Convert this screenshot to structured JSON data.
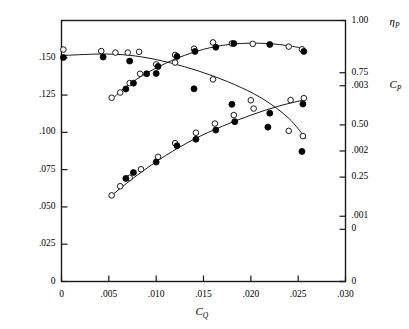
{
  "figure": {
    "background_color": "#ffffff",
    "line_color": "#1a1a1a",
    "marker_filled_color": "#000000",
    "marker_open_color": "#ffffff"
  },
  "chart_data": {
    "type": "scatter",
    "title": "",
    "subtitle": "",
    "grid": false,
    "legend_position": "none",
    "xlabel": "C_Q",
    "xlabel_base": "C",
    "xlabel_sub": "Q",
    "xlim": [
      0.0,
      0.03
    ],
    "x_ticks": [
      0.0,
      0.005,
      0.01,
      0.015,
      0.02,
      0.025,
      0.03
    ],
    "x_tick_labels": [
      "0",
      ".005",
      ".010",
      ".015",
      ".020",
      ".025",
      ".030"
    ],
    "left_axis": {
      "label_base": "C",
      "label_sub": "H",
      "lim": [
        0.0,
        0.175
      ],
      "ticks": [
        0.0,
        0.025,
        0.05,
        0.075,
        0.1,
        0.125,
        0.15
      ],
      "tick_labels": [
        "0",
        ".025",
        ".050",
        ".075",
        ".100",
        ".125",
        ".150"
      ]
    },
    "right_axis_top": {
      "label_base": "η",
      "label_sub": "P",
      "lim": [
        -0.25,
        1.0
      ],
      "ticks": [
        1.0,
        0.75,
        0.5,
        0.25,
        0.0
      ],
      "tick_labels": [
        "1.00",
        "0.75",
        "0.50",
        "0.25",
        "0"
      ]
    },
    "right_axis_bottom": {
      "label_base": "C",
      "label_sub": "P",
      "lim": [
        0.0,
        0.004
      ],
      "ticks": [
        0.003,
        0.002,
        0.001,
        0.0
      ],
      "tick_labels": [
        ".003",
        ".002",
        ".001",
        "0"
      ]
    },
    "series": [
      {
        "name": "eta_P measured (open)",
        "marker": "open-circle",
        "axis": "right_axis_top",
        "points": [
          {
            "x": 0.0053,
            "y": 0.63
          },
          {
            "x": 0.0062,
            "y": 0.655
          },
          {
            "x": 0.0072,
            "y": 0.7
          },
          {
            "x": 0.0083,
            "y": 0.745
          },
          {
            "x": 0.01,
            "y": 0.79
          },
          {
            "x": 0.012,
            "y": 0.835
          },
          {
            "x": 0.014,
            "y": 0.865
          },
          {
            "x": 0.016,
            "y": 0.895
          },
          {
            "x": 0.018,
            "y": 0.89
          },
          {
            "x": 0.0202,
            "y": 0.888
          },
          {
            "x": 0.024,
            "y": 0.875
          },
          {
            "x": 0.0254,
            "y": 0.862
          }
        ]
      },
      {
        "name": "eta_P predicted (filled)",
        "marker": "filled-circle",
        "axis": "right_axis_top",
        "points": [
          {
            "x": 0.0068,
            "y": 0.672
          },
          {
            "x": 0.0076,
            "y": 0.7
          },
          {
            "x": 0.009,
            "y": 0.745
          },
          {
            "x": 0.0102,
            "y": 0.78
          },
          {
            "x": 0.0122,
            "y": 0.828
          },
          {
            "x": 0.0141,
            "y": 0.852
          },
          {
            "x": 0.0163,
            "y": 0.872
          },
          {
            "x": 0.0182,
            "y": 0.89
          },
          {
            "x": 0.022,
            "y": 0.885
          },
          {
            "x": 0.0256,
            "y": 0.852
          }
        ]
      },
      {
        "name": "eta_P fitted curve",
        "marker": "line",
        "axis": "right_axis_top",
        "points": [
          {
            "x": 0.0053,
            "y": 0.622
          },
          {
            "x": 0.007,
            "y": 0.69
          },
          {
            "x": 0.009,
            "y": 0.748
          },
          {
            "x": 0.011,
            "y": 0.795
          },
          {
            "x": 0.013,
            "y": 0.833
          },
          {
            "x": 0.015,
            "y": 0.862
          },
          {
            "x": 0.017,
            "y": 0.881
          },
          {
            "x": 0.019,
            "y": 0.89
          },
          {
            "x": 0.021,
            "y": 0.891
          },
          {
            "x": 0.023,
            "y": 0.885
          },
          {
            "x": 0.0255,
            "y": 0.868
          }
        ]
      },
      {
        "name": "C_H measured (open)",
        "marker": "open-circle",
        "axis": "left_axis",
        "points": [
          {
            "x": 0.0002,
            "y": 0.1555
          },
          {
            "x": 0.0042,
            "y": 0.1545
          },
          {
            "x": 0.0057,
            "y": 0.1535
          },
          {
            "x": 0.007,
            "y": 0.1535
          },
          {
            "x": 0.0082,
            "y": 0.154
          },
          {
            "x": 0.012,
            "y": 0.1468
          },
          {
            "x": 0.016,
            "y": 0.1355
          },
          {
            "x": 0.02,
            "y": 0.1215
          },
          {
            "x": 0.024,
            "y": 0.101
          },
          {
            "x": 0.0255,
            "y": 0.0975
          }
        ]
      },
      {
        "name": "C_H predicted (filled)",
        "marker": "filled-circle",
        "axis": "left_axis",
        "points": [
          {
            "x": 0.0002,
            "y": 0.1502
          },
          {
            "x": 0.0044,
            "y": 0.1505
          },
          {
            "x": 0.0072,
            "y": 0.1478
          },
          {
            "x": 0.01,
            "y": 0.1395
          },
          {
            "x": 0.014,
            "y": 0.1292
          },
          {
            "x": 0.018,
            "y": 0.1188
          },
          {
            "x": 0.0218,
            "y": 0.1035
          },
          {
            "x": 0.0254,
            "y": 0.0872
          }
        ]
      },
      {
        "name": "C_H fitted curve",
        "marker": "line",
        "axis": "left_axis",
        "points": [
          {
            "x": 0.0,
            "y": 0.1515
          },
          {
            "x": 0.004,
            "y": 0.1525
          },
          {
            "x": 0.007,
            "y": 0.1518
          },
          {
            "x": 0.01,
            "y": 0.1488
          },
          {
            "x": 0.013,
            "y": 0.144
          },
          {
            "x": 0.016,
            "y": 0.1378
          },
          {
            "x": 0.019,
            "y": 0.13
          },
          {
            "x": 0.0215,
            "y": 0.1215
          },
          {
            "x": 0.024,
            "y": 0.1095
          },
          {
            "x": 0.0258,
            "y": 0.096
          }
        ]
      },
      {
        "name": "C_P measured (open)",
        "marker": "open-circle",
        "axis": "right_axis_bottom",
        "points": [
          {
            "x": 0.0053,
            "y": 0.00132
          },
          {
            "x": 0.0062,
            "y": 0.00146
          },
          {
            "x": 0.0072,
            "y": 0.00159
          },
          {
            "x": 0.0084,
            "y": 0.00172
          },
          {
            "x": 0.0102,
            "y": 0.00191
          },
          {
            "x": 0.012,
            "y": 0.00212
          },
          {
            "x": 0.0142,
            "y": 0.00228
          },
          {
            "x": 0.0162,
            "y": 0.00242
          },
          {
            "x": 0.0182,
            "y": 0.00255
          },
          {
            "x": 0.0203,
            "y": 0.00265
          },
          {
            "x": 0.0242,
            "y": 0.00278
          },
          {
            "x": 0.0256,
            "y": 0.00281
          }
        ]
      },
      {
        "name": "C_P predicted (filled)",
        "marker": "filled-circle",
        "axis": "right_axis_bottom",
        "points": [
          {
            "x": 0.0068,
            "y": 0.00158
          },
          {
            "x": 0.0076,
            "y": 0.00167
          },
          {
            "x": 0.01,
            "y": 0.00183
          },
          {
            "x": 0.0122,
            "y": 0.00208
          },
          {
            "x": 0.0142,
            "y": 0.00218
          },
          {
            "x": 0.0163,
            "y": 0.00232
          },
          {
            "x": 0.0183,
            "y": 0.00245
          },
          {
            "x": 0.022,
            "y": 0.00258
          },
          {
            "x": 0.0255,
            "y": 0.00272
          }
        ]
      },
      {
        "name": "C_P fitted curve",
        "marker": "line",
        "axis": "right_axis_bottom",
        "points": [
          {
            "x": 0.0053,
            "y": 0.00132
          },
          {
            "x": 0.008,
            "y": 0.00163
          },
          {
            "x": 0.011,
            "y": 0.00193
          },
          {
            "x": 0.014,
            "y": 0.00218
          },
          {
            "x": 0.017,
            "y": 0.00238
          },
          {
            "x": 0.02,
            "y": 0.00255
          },
          {
            "x": 0.023,
            "y": 0.00269
          },
          {
            "x": 0.0258,
            "y": 0.00279
          }
        ]
      }
    ]
  }
}
